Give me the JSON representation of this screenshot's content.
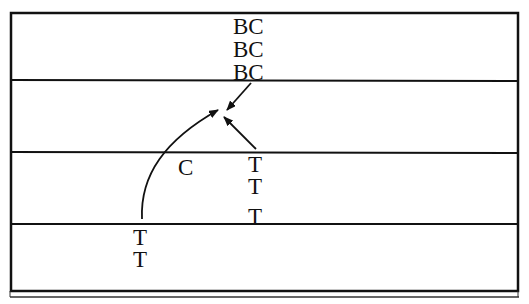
{
  "diagram": {
    "type": "layered-transition-diagram",
    "colors": {
      "line": "#111111",
      "background": "#ffffff"
    },
    "layers": [
      {
        "index": 0,
        "labels": [
          "BC",
          "BC",
          "BC"
        ]
      },
      {
        "index": 1,
        "labels": []
      },
      {
        "index": 2,
        "labels": [
          "C",
          "T",
          "T",
          "T"
        ]
      },
      {
        "index": 3,
        "labels": [
          "T",
          "T"
        ]
      }
    ],
    "labels": {
      "bc1": "BC",
      "bc2": "BC",
      "bc3": "BC",
      "c": "C",
      "t_right_1": "T",
      "t_right_2": "T",
      "t_right_3": "T",
      "t_left_1": "T",
      "t_left_2": "T"
    },
    "arrows": [
      {
        "from": "BC (layer 0)",
        "to": "convergence point (layer 1)",
        "style": "straight"
      },
      {
        "from": "T (layer 2)",
        "to": "convergence point (layer 1)",
        "style": "straight"
      },
      {
        "from": "T (layer 3)",
        "to": "convergence point (layer 1)",
        "style": "curved"
      }
    ]
  }
}
